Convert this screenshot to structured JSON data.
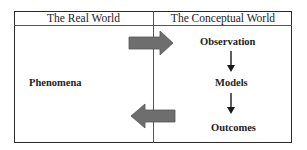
{
  "header": {
    "left_title": "The Real World",
    "right_title": "The Conceptual World"
  },
  "real_world": {
    "node": "Phenomena"
  },
  "conceptual_world": {
    "nodes": [
      "Observation",
      "Models",
      "Outcomes"
    ]
  },
  "arrows": {
    "to_conceptual": "Phenomena → Observation",
    "to_real": "Outcomes → Phenomena",
    "flow": [
      "Observation → Models",
      "Models → Outcomes"
    ]
  },
  "colors": {
    "block_arrow": "#6e6e6e",
    "line": "#2a2a2a"
  }
}
